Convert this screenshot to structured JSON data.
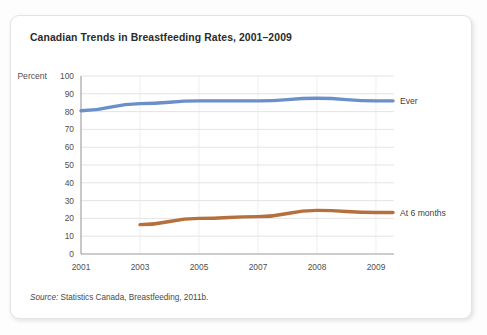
{
  "figure": {
    "title": "Canadian Trends in Breastfeeding Rates, 2001–2009",
    "source_label": "Source:",
    "source_text": " Statistics Canada, Breastfeeding, 2011b."
  },
  "chart_data": {
    "type": "line",
    "title": "Canadian Trends in Breastfeeding Rates, 2001–2009",
    "xlabel": "Year",
    "ylabel": "Percent",
    "ylim": [
      0,
      100
    ],
    "yticks": [
      0,
      10,
      20,
      30,
      40,
      50,
      60,
      70,
      80,
      90,
      100
    ],
    "categories": [
      "2001",
      "2003",
      "2005",
      "2007",
      "2008",
      "2009"
    ],
    "grid": "horizontal-and-vertical",
    "legend": "inline-right-of-line-end",
    "series": [
      {
        "name": "Ever",
        "color": "#6b8fc9",
        "x": [
          "2001",
          "2003",
          "2005",
          "2007",
          "2008",
          "2009"
        ],
        "values": [
          80.5,
          84.5,
          86.0,
          86.0,
          87.5,
          86.0
        ]
      },
      {
        "name": "At 6 months",
        "color": "#b5703d",
        "x": [
          "2003",
          "2005",
          "2007",
          "2008",
          "2009"
        ],
        "values": [
          16.5,
          20.0,
          21.0,
          24.5,
          23.3
        ]
      }
    ]
  }
}
